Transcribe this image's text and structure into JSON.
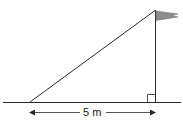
{
  "diagram": {
    "type": "right-triangle-flagpole",
    "base_label": "5 m",
    "colors": {
      "stroke": "#2a2a2a",
      "flag_fill": "#8c8c8c",
      "background": "#ffffff"
    },
    "elements": {
      "ground": "ground-line",
      "pole": "vertical-flagpole",
      "hypotenuse": "sloped-line",
      "right_angle": "right-angle-marker",
      "flag": "flag-pennant",
      "dimension": "double-arrow-5m"
    }
  }
}
